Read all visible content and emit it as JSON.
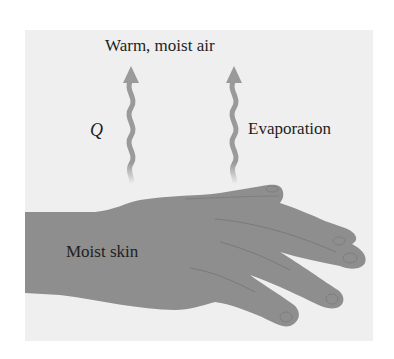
{
  "diagram": {
    "top_label": "Warm, moist air",
    "heat_label": "Q",
    "evaporation_label": "Evaporation",
    "skin_label": "Moist skin"
  },
  "colors": {
    "panel": "#efefef",
    "hand": "#8e8e8e",
    "arrow": "#9a9a9a",
    "text": "#1e1e1e"
  }
}
